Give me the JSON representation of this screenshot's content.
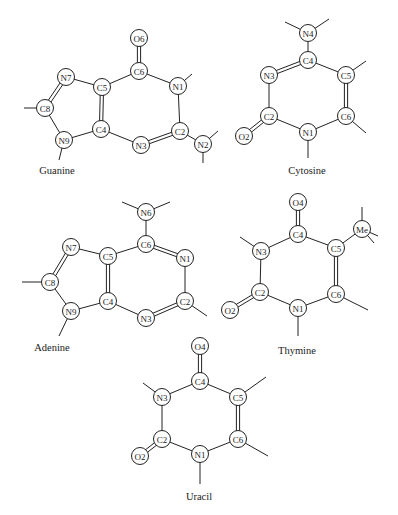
{
  "figure": {
    "background": "#ffffff",
    "line_color": "#222222",
    "atom_radius": 8.5
  },
  "molecules": [
    {
      "name": "Guanine",
      "label_pos": [
        57,
        174
      ],
      "atoms": [
        {
          "id": "O6",
          "x": 139,
          "y": 38
        },
        {
          "id": "C6",
          "x": 139,
          "y": 71
        },
        {
          "id": "N1",
          "x": 178,
          "y": 86
        },
        {
          "id": "C2",
          "x": 180,
          "y": 131
        },
        {
          "id": "N2",
          "x": 203,
          "y": 144
        },
        {
          "id": "N3",
          "x": 141,
          "y": 145
        },
        {
          "id": "C4",
          "x": 101,
          "y": 129
        },
        {
          "id": "C5",
          "x": 102,
          "y": 87
        },
        {
          "id": "N7",
          "x": 66,
          "y": 77
        },
        {
          "id": "C8",
          "x": 45,
          "y": 108
        },
        {
          "id": "N9",
          "x": 64,
          "y": 140
        }
      ],
      "bonds": [
        [
          "O6",
          "C6",
          2
        ],
        [
          "C6",
          "N1",
          1
        ],
        [
          "N1",
          "C2",
          1
        ],
        [
          "C2",
          "N3",
          2
        ],
        [
          "N3",
          "C4",
          1
        ],
        [
          "C4",
          "C5",
          2
        ],
        [
          "C5",
          "C6",
          1
        ],
        [
          "C5",
          "N7",
          1
        ],
        [
          "N7",
          "C8",
          2
        ],
        [
          "C8",
          "N9",
          1
        ],
        [
          "N9",
          "C4",
          1
        ],
        [
          "C2",
          "N2",
          1
        ]
      ],
      "stubs": [
        [
          "N1",
          192,
          74
        ],
        [
          "N2",
          218,
          131
        ],
        [
          "N2",
          203,
          163
        ],
        [
          "C8",
          24,
          108
        ],
        [
          "N9",
          59,
          160
        ]
      ]
    },
    {
      "name": "Cytosine",
      "label_pos": [
        307,
        174
      ],
      "atoms": [
        {
          "id": "N4",
          "x": 308,
          "y": 33
        },
        {
          "id": "C4",
          "x": 308,
          "y": 60
        },
        {
          "id": "N3",
          "x": 269,
          "y": 75
        },
        {
          "id": "C5",
          "x": 346,
          "y": 75
        },
        {
          "id": "C2",
          "x": 269,
          "y": 116
        },
        {
          "id": "C6",
          "x": 346,
          "y": 116
        },
        {
          "id": "N1",
          "x": 308,
          "y": 132
        },
        {
          "id": "O2",
          "x": 244,
          "y": 136
        }
      ],
      "bonds": [
        [
          "N4",
          "C4",
          1
        ],
        [
          "C4",
          "N3",
          2
        ],
        [
          "C4",
          "C5",
          1
        ],
        [
          "N3",
          "C2",
          1
        ],
        [
          "C5",
          "C6",
          2
        ],
        [
          "C2",
          "N1",
          1
        ],
        [
          "N1",
          "C6",
          1
        ],
        [
          "C2",
          "O2",
          2
        ]
      ],
      "stubs": [
        [
          "N4",
          285,
          22
        ],
        [
          "N4",
          329,
          19
        ],
        [
          "C5",
          366,
          61
        ],
        [
          "C6",
          366,
          133
        ],
        [
          "N1",
          308,
          158
        ]
      ]
    },
    {
      "name": "Adenine",
      "label_pos": [
        52,
        351
      ],
      "atoms": [
        {
          "id": "N6",
          "x": 146,
          "y": 212
        },
        {
          "id": "C6",
          "x": 146,
          "y": 244
        },
        {
          "id": "N1",
          "x": 185,
          "y": 258
        },
        {
          "id": "C2",
          "x": 185,
          "y": 301
        },
        {
          "id": "N3",
          "x": 146,
          "y": 318
        },
        {
          "id": "C4",
          "x": 108,
          "y": 301
        },
        {
          "id": "C5",
          "x": 108,
          "y": 256
        },
        {
          "id": "N7",
          "x": 71,
          "y": 247
        },
        {
          "id": "C8",
          "x": 50,
          "y": 282
        },
        {
          "id": "N9",
          "x": 71,
          "y": 311
        }
      ],
      "bonds": [
        [
          "N6",
          "C6",
          1
        ],
        [
          "C6",
          "N1",
          2
        ],
        [
          "N1",
          "C2",
          1
        ],
        [
          "C2",
          "N3",
          2
        ],
        [
          "N3",
          "C4",
          1
        ],
        [
          "C4",
          "C5",
          2
        ],
        [
          "C5",
          "C6",
          1
        ],
        [
          "C5",
          "N7",
          1
        ],
        [
          "N7",
          "C8",
          2
        ],
        [
          "C8",
          "N9",
          1
        ],
        [
          "N9",
          "C4",
          1
        ]
      ],
      "stubs": [
        [
          "N6",
          122,
          202
        ],
        [
          "N6",
          170,
          202
        ],
        [
          "C2",
          207,
          316
        ],
        [
          "C8",
          22,
          282
        ],
        [
          "N9",
          59,
          336
        ]
      ]
    },
    {
      "name": "Thymine",
      "label_pos": [
        297,
        354
      ],
      "atoms": [
        {
          "id": "O4",
          "x": 298,
          "y": 202
        },
        {
          "id": "C4",
          "x": 298,
          "y": 234
        },
        {
          "id": "N3",
          "x": 261,
          "y": 251
        },
        {
          "id": "C5",
          "x": 336,
          "y": 248
        },
        {
          "id": "Me",
          "x": 362,
          "y": 229
        },
        {
          "id": "C2",
          "x": 260,
          "y": 292
        },
        {
          "id": "C6",
          "x": 336,
          "y": 294
        },
        {
          "id": "N1",
          "x": 298,
          "y": 308
        },
        {
          "id": "O2",
          "x": 230,
          "y": 310
        }
      ],
      "bonds": [
        [
          "O4",
          "C4",
          2
        ],
        [
          "C4",
          "N3",
          1
        ],
        [
          "C4",
          "C5",
          1
        ],
        [
          "C5",
          "Me",
          1
        ],
        [
          "N3",
          "C2",
          1
        ],
        [
          "C5",
          "C6",
          2
        ],
        [
          "C2",
          "N1",
          1
        ],
        [
          "N1",
          "C6",
          1
        ],
        [
          "C2",
          "O2",
          2
        ]
      ],
      "stubs": [
        [
          "N3",
          240,
          237
        ],
        [
          "Me",
          362,
          207
        ],
        [
          "Me",
          378,
          236
        ],
        [
          "Me",
          374,
          243
        ],
        [
          "C6",
          368,
          310
        ],
        [
          "N1",
          298,
          336
        ]
      ]
    },
    {
      "name": "Uracil",
      "label_pos": [
        199,
        500
      ],
      "atoms": [
        {
          "id": "O4",
          "x": 200,
          "y": 346
        },
        {
          "id": "C4",
          "x": 200,
          "y": 381
        },
        {
          "id": "N3",
          "x": 162,
          "y": 397
        },
        {
          "id": "C5",
          "x": 238,
          "y": 397
        },
        {
          "id": "C2",
          "x": 162,
          "y": 439
        },
        {
          "id": "C6",
          "x": 238,
          "y": 439
        },
        {
          "id": "N1",
          "x": 200,
          "y": 454
        },
        {
          "id": "O2",
          "x": 140,
          "y": 456
        }
      ],
      "bonds": [
        [
          "O4",
          "C4",
          2
        ],
        [
          "C4",
          "N3",
          1
        ],
        [
          "C4",
          "C5",
          1
        ],
        [
          "N3",
          "C2",
          1
        ],
        [
          "C5",
          "C6",
          2
        ],
        [
          "C2",
          "N1",
          1
        ],
        [
          "N1",
          "C6",
          1
        ],
        [
          "C2",
          "O2",
          2
        ]
      ],
      "stubs": [
        [
          "N3",
          143,
          383
        ],
        [
          "C5",
          266,
          377
        ],
        [
          "C6",
          268,
          456
        ],
        [
          "N1",
          200,
          484
        ]
      ]
    }
  ]
}
